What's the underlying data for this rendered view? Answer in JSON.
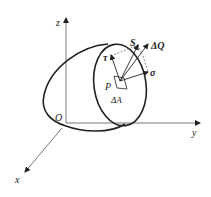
{
  "figure": {
    "axes": {
      "origin_label": "O",
      "x_label": "x",
      "y_label": "y",
      "z_label": "z"
    },
    "point_label": "P",
    "area_label": "ΔA",
    "vectors": {
      "resultant_stress": "S",
      "force": "ΔQ",
      "shear_stress": "τ",
      "normal_stress": "σ"
    },
    "colors": {
      "line": "#222222",
      "axis": "#555555",
      "background": "#ffffff"
    }
  }
}
